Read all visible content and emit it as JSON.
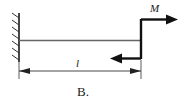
{
  "figure": {
    "caption": "B.",
    "type": "cantilever-beam-free-body-diagram",
    "labels": {
      "moment": "M",
      "length": "l"
    },
    "colors": {
      "line": "#1a1a1a",
      "beam": "#555555",
      "background": "#ffffff"
    },
    "elements": {
      "support_name": "fixed-wall-support",
      "beam_name": "horizontal-beam",
      "couple_name": "applied-moment-couple",
      "dimension_name": "length-dimension-line"
    }
  },
  "geometry": {
    "wall_x": 19,
    "beam_y": 40,
    "beam_start_x": 19,
    "beam_end_x": 141,
    "couple_top_y": 19,
    "couple_bottom_y": 59,
    "dimension_y": 71,
    "top_arrow_end_x": 177,
    "bottom_arrow_end_x": 112
  }
}
